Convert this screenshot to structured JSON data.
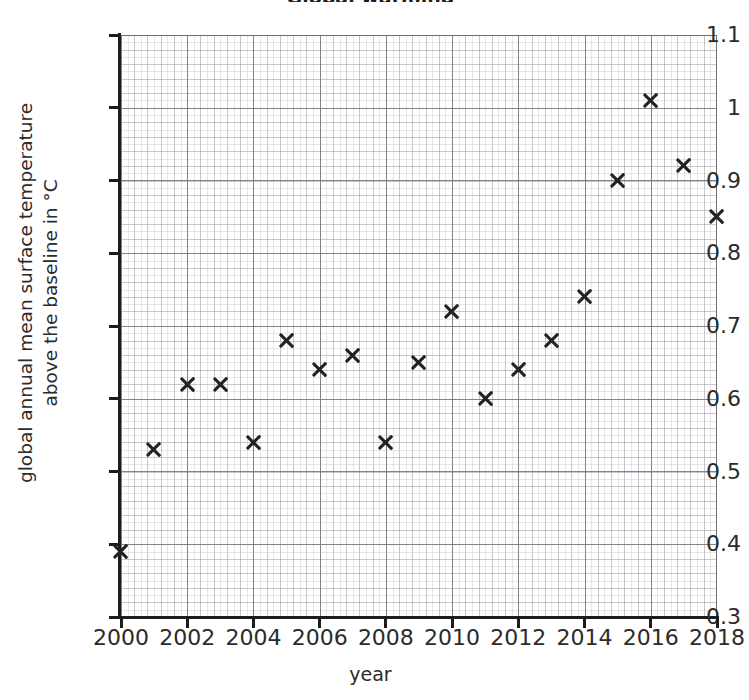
{
  "chart_data": {
    "type": "scatter",
    "title": "Global warming",
    "xlabel": "year",
    "ylabel": "global annual mean surface temperature above the baseline in °C",
    "x": [
      2000,
      2001,
      2002,
      2003,
      2004,
      2005,
      2006,
      2007,
      2008,
      2009,
      2010,
      2011,
      2012,
      2013,
      2014,
      2015,
      2016,
      2017,
      2018
    ],
    "values": [
      0.39,
      0.53,
      0.62,
      0.62,
      0.54,
      0.68,
      0.64,
      0.66,
      0.54,
      0.65,
      0.72,
      0.6,
      0.64,
      0.68,
      0.74,
      0.9,
      1.01,
      0.92,
      0.85
    ],
    "xlim": [
      2000,
      2018
    ],
    "ylim": [
      0.3,
      1.1
    ],
    "x_ticks": [
      "2000",
      "2002",
      "2004",
      "2006",
      "2008",
      "2010",
      "2012",
      "2014",
      "2016",
      "2018"
    ],
    "x_tick_values": [
      2000,
      2002,
      2004,
      2006,
      2008,
      2010,
      2012,
      2014,
      2016,
      2018
    ],
    "y_ticks": [
      "1.1",
      "1",
      "0.9",
      "0.8",
      "0.7",
      "0.6",
      "0.5",
      "0.4",
      "0.3"
    ],
    "y_tick_values": [
      1.1,
      1.0,
      0.9,
      0.8,
      0.7,
      0.6,
      0.5,
      0.4,
      0.3
    ],
    "grid": true,
    "grid_minor": true,
    "legend": null,
    "marker": "x",
    "marker_color": "#222222"
  },
  "axes": {
    "y_title": "global annual mean surface temperature\nabove the baseline in °C",
    "y_title_line1": "global annual mean surface temperature",
    "y_title_line2": "above the baseline in °C",
    "x_title": "year"
  },
  "colors": {
    "marker": "#222222",
    "axis": "#1c1c1c",
    "grid_major": "#787878",
    "grid_minor": "#aaaab4",
    "background": "#ffffff",
    "text": "#2b2b2b"
  }
}
